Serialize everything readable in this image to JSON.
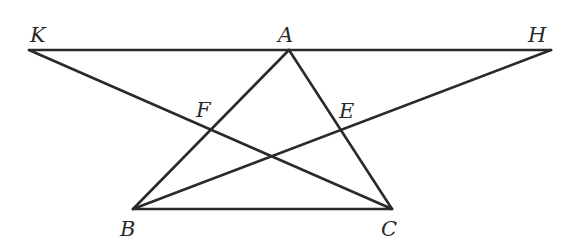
{
  "diagram": {
    "stroke_color": "#2a2a2a",
    "stroke_width": 2.6,
    "points": {
      "K": {
        "label": "K",
        "x": 29,
        "y": 50
      },
      "A": {
        "label": "A",
        "x": 289,
        "y": 50
      },
      "H": {
        "label": "H",
        "x": 551,
        "y": 50
      },
      "B": {
        "label": "B",
        "x": 133,
        "y": 209
      },
      "C": {
        "label": "C",
        "x": 392,
        "y": 209
      },
      "F": {
        "label": "F",
        "x": 211,
        "y": 130
      },
      "E": {
        "label": "E",
        "x": 342,
        "y": 131
      }
    },
    "segments": [
      [
        "K",
        "H"
      ],
      [
        "A",
        "B"
      ],
      [
        "A",
        "C"
      ],
      [
        "B",
        "C"
      ],
      [
        "K",
        "C"
      ],
      [
        "B",
        "H"
      ]
    ],
    "labels": {
      "K": "K",
      "A": "A",
      "H": "H",
      "B": "B",
      "C": "C",
      "F": "F",
      "E": "E"
    }
  }
}
